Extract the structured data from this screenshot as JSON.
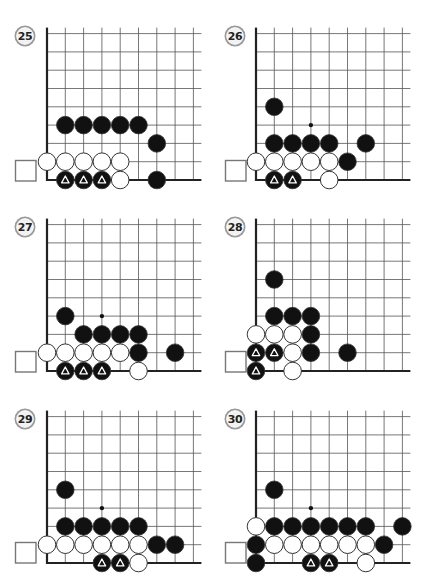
{
  "page": {
    "layout": {
      "columns": 2,
      "rows": 3
    }
  },
  "style": {
    "grid_line_color": "#555555",
    "edge_line_color": "#222222",
    "black_stone": "#111111",
    "white_stone": "#ffffff",
    "stone_outline": "#333333",
    "triangle_color": "#ffffff",
    "badge_ring": "#9a9a9a",
    "badge_fill": "#f2f2f2",
    "marker_square_stroke": "#777777"
  },
  "grid": {
    "spacing": 18.3,
    "cols_visible": 9,
    "rows_visible": 9,
    "stone_radius": 8.8
  },
  "problems": [
    {
      "number": "25",
      "origin": {
        "x": 47,
        "y": 180
      },
      "badge": {
        "x": 25,
        "y": 36
      },
      "square": {
        "x": 15,
        "y": 160
      },
      "stones": [
        {
          "c": 1,
          "r": 3,
          "color": "black"
        },
        {
          "c": 2,
          "r": 3,
          "color": "black"
        },
        {
          "c": 3,
          "r": 3,
          "color": "black"
        },
        {
          "c": 4,
          "r": 3,
          "color": "black"
        },
        {
          "c": 5,
          "r": 3,
          "color": "black"
        },
        {
          "c": 6,
          "r": 2,
          "color": "black"
        },
        {
          "c": 0,
          "r": 1,
          "color": "white"
        },
        {
          "c": 1,
          "r": 1,
          "color": "white"
        },
        {
          "c": 2,
          "r": 1,
          "color": "white"
        },
        {
          "c": 3,
          "r": 1,
          "color": "white"
        },
        {
          "c": 4,
          "r": 1,
          "color": "white"
        },
        {
          "c": 1,
          "r": 0,
          "color": "black",
          "mark": "triangle"
        },
        {
          "c": 2,
          "r": 0,
          "color": "black",
          "mark": "triangle"
        },
        {
          "c": 3,
          "r": 0,
          "color": "black",
          "mark": "triangle"
        },
        {
          "c": 4,
          "r": 0,
          "color": "white"
        },
        {
          "c": 6,
          "r": 0,
          "color": "black"
        }
      ],
      "dots": []
    },
    {
      "number": "26",
      "origin": {
        "x": 256,
        "y": 180
      },
      "badge": {
        "x": 235,
        "y": 36
      },
      "square": {
        "x": 225,
        "y": 160
      },
      "stones": [
        {
          "c": 1,
          "r": 4,
          "color": "black"
        },
        {
          "c": 1,
          "r": 2,
          "color": "black"
        },
        {
          "c": 2,
          "r": 2,
          "color": "black"
        },
        {
          "c": 3,
          "r": 2,
          "color": "black"
        },
        {
          "c": 4,
          "r": 2,
          "color": "black"
        },
        {
          "c": 6,
          "r": 2,
          "color": "black"
        },
        {
          "c": 0,
          "r": 1,
          "color": "white"
        },
        {
          "c": 1,
          "r": 1,
          "color": "white"
        },
        {
          "c": 2,
          "r": 1,
          "color": "white"
        },
        {
          "c": 3,
          "r": 1,
          "color": "white"
        },
        {
          "c": 4,
          "r": 1,
          "color": "white"
        },
        {
          "c": 5,
          "r": 1,
          "color": "black"
        },
        {
          "c": 1,
          "r": 0,
          "color": "black",
          "mark": "triangle"
        },
        {
          "c": 2,
          "r": 0,
          "color": "black",
          "mark": "triangle"
        },
        {
          "c": 4,
          "r": 0,
          "color": "white"
        }
      ],
      "dots": [
        {
          "c": 3,
          "r": 3
        }
      ]
    },
    {
      "number": "27",
      "origin": {
        "x": 47,
        "y": 371
      },
      "badge": {
        "x": 25,
        "y": 227
      },
      "square": {
        "x": 15,
        "y": 351
      },
      "stones": [
        {
          "c": 1,
          "r": 3,
          "color": "black"
        },
        {
          "c": 2,
          "r": 2,
          "color": "black"
        },
        {
          "c": 3,
          "r": 2,
          "color": "black"
        },
        {
          "c": 4,
          "r": 2,
          "color": "black"
        },
        {
          "c": 5,
          "r": 2,
          "color": "black"
        },
        {
          "c": 0,
          "r": 1,
          "color": "white"
        },
        {
          "c": 1,
          "r": 1,
          "color": "white"
        },
        {
          "c": 2,
          "r": 1,
          "color": "white"
        },
        {
          "c": 3,
          "r": 1,
          "color": "white"
        },
        {
          "c": 4,
          "r": 1,
          "color": "white"
        },
        {
          "c": 5,
          "r": 1,
          "color": "black"
        },
        {
          "c": 7,
          "r": 1,
          "color": "black"
        },
        {
          "c": 1,
          "r": 0,
          "color": "black",
          "mark": "triangle"
        },
        {
          "c": 2,
          "r": 0,
          "color": "black",
          "mark": "triangle"
        },
        {
          "c": 3,
          "r": 0,
          "color": "black",
          "mark": "triangle"
        },
        {
          "c": 5,
          "r": 0,
          "color": "white"
        }
      ],
      "dots": [
        {
          "c": 3,
          "r": 3
        }
      ]
    },
    {
      "number": "28",
      "origin": {
        "x": 256,
        "y": 371
      },
      "badge": {
        "x": 235,
        "y": 227
      },
      "square": {
        "x": 225,
        "y": 351
      },
      "stones": [
        {
          "c": 1,
          "r": 5,
          "color": "black"
        },
        {
          "c": 1,
          "r": 3,
          "color": "black"
        },
        {
          "c": 2,
          "r": 3,
          "color": "black"
        },
        {
          "c": 3,
          "r": 3,
          "color": "black"
        },
        {
          "c": 0,
          "r": 2,
          "color": "white"
        },
        {
          "c": 1,
          "r": 2,
          "color": "white"
        },
        {
          "c": 2,
          "r": 2,
          "color": "white"
        },
        {
          "c": 3,
          "r": 2,
          "color": "black"
        },
        {
          "c": 0,
          "r": 1,
          "color": "black",
          "mark": "triangle"
        },
        {
          "c": 1,
          "r": 1,
          "color": "black",
          "mark": "triangle"
        },
        {
          "c": 2,
          "r": 1,
          "color": "white"
        },
        {
          "c": 3,
          "r": 1,
          "color": "black"
        },
        {
          "c": 5,
          "r": 1,
          "color": "black"
        },
        {
          "c": 0,
          "r": 0,
          "color": "black",
          "mark": "triangle"
        },
        {
          "c": 2,
          "r": 0,
          "color": "white"
        }
      ],
      "dots": []
    },
    {
      "number": "29",
      "origin": {
        "x": 47,
        "y": 563
      },
      "badge": {
        "x": 25,
        "y": 419
      },
      "square": {
        "x": 15,
        "y": 542
      },
      "stones": [
        {
          "c": 1,
          "r": 4,
          "color": "black"
        },
        {
          "c": 1,
          "r": 2,
          "color": "black"
        },
        {
          "c": 2,
          "r": 2,
          "color": "black"
        },
        {
          "c": 3,
          "r": 2,
          "color": "black"
        },
        {
          "c": 4,
          "r": 2,
          "color": "black"
        },
        {
          "c": 5,
          "r": 2,
          "color": "black"
        },
        {
          "c": 0,
          "r": 1,
          "color": "white"
        },
        {
          "c": 1,
          "r": 1,
          "color": "white"
        },
        {
          "c": 2,
          "r": 1,
          "color": "white"
        },
        {
          "c": 3,
          "r": 1,
          "color": "white"
        },
        {
          "c": 4,
          "r": 1,
          "color": "white"
        },
        {
          "c": 5,
          "r": 1,
          "color": "white"
        },
        {
          "c": 6,
          "r": 1,
          "color": "black"
        },
        {
          "c": 7,
          "r": 1,
          "color": "black"
        },
        {
          "c": 3,
          "r": 0,
          "color": "black",
          "mark": "triangle"
        },
        {
          "c": 4,
          "r": 0,
          "color": "black",
          "mark": "triangle"
        },
        {
          "c": 5,
          "r": 0,
          "color": "white"
        }
      ],
      "dots": [
        {
          "c": 3,
          "r": 3
        }
      ]
    },
    {
      "number": "30",
      "origin": {
        "x": 256,
        "y": 563
      },
      "badge": {
        "x": 235,
        "y": 419
      },
      "square": {
        "x": 225,
        "y": 542
      },
      "stones": [
        {
          "c": 1,
          "r": 4,
          "color": "black"
        },
        {
          "c": 0,
          "r": 2,
          "color": "white"
        },
        {
          "c": 1,
          "r": 2,
          "color": "black"
        },
        {
          "c": 2,
          "r": 2,
          "color": "black"
        },
        {
          "c": 3,
          "r": 2,
          "color": "black"
        },
        {
          "c": 4,
          "r": 2,
          "color": "black"
        },
        {
          "c": 5,
          "r": 2,
          "color": "black"
        },
        {
          "c": 6,
          "r": 2,
          "color": "black"
        },
        {
          "c": 8,
          "r": 2,
          "color": "black"
        },
        {
          "c": 0,
          "r": 1,
          "color": "black"
        },
        {
          "c": 1,
          "r": 1,
          "color": "white"
        },
        {
          "c": 2,
          "r": 1,
          "color": "white"
        },
        {
          "c": 3,
          "r": 1,
          "color": "white"
        },
        {
          "c": 4,
          "r": 1,
          "color": "white"
        },
        {
          "c": 5,
          "r": 1,
          "color": "white"
        },
        {
          "c": 6,
          "r": 1,
          "color": "white"
        },
        {
          "c": 7,
          "r": 1,
          "color": "black"
        },
        {
          "c": 0,
          "r": 0,
          "color": "black"
        },
        {
          "c": 3,
          "r": 0,
          "color": "black",
          "mark": "triangle"
        },
        {
          "c": 4,
          "r": 0,
          "color": "black",
          "mark": "triangle"
        },
        {
          "c": 6,
          "r": 0,
          "color": "white"
        }
      ],
      "dots": [
        {
          "c": 3,
          "r": 3
        }
      ]
    }
  ]
}
